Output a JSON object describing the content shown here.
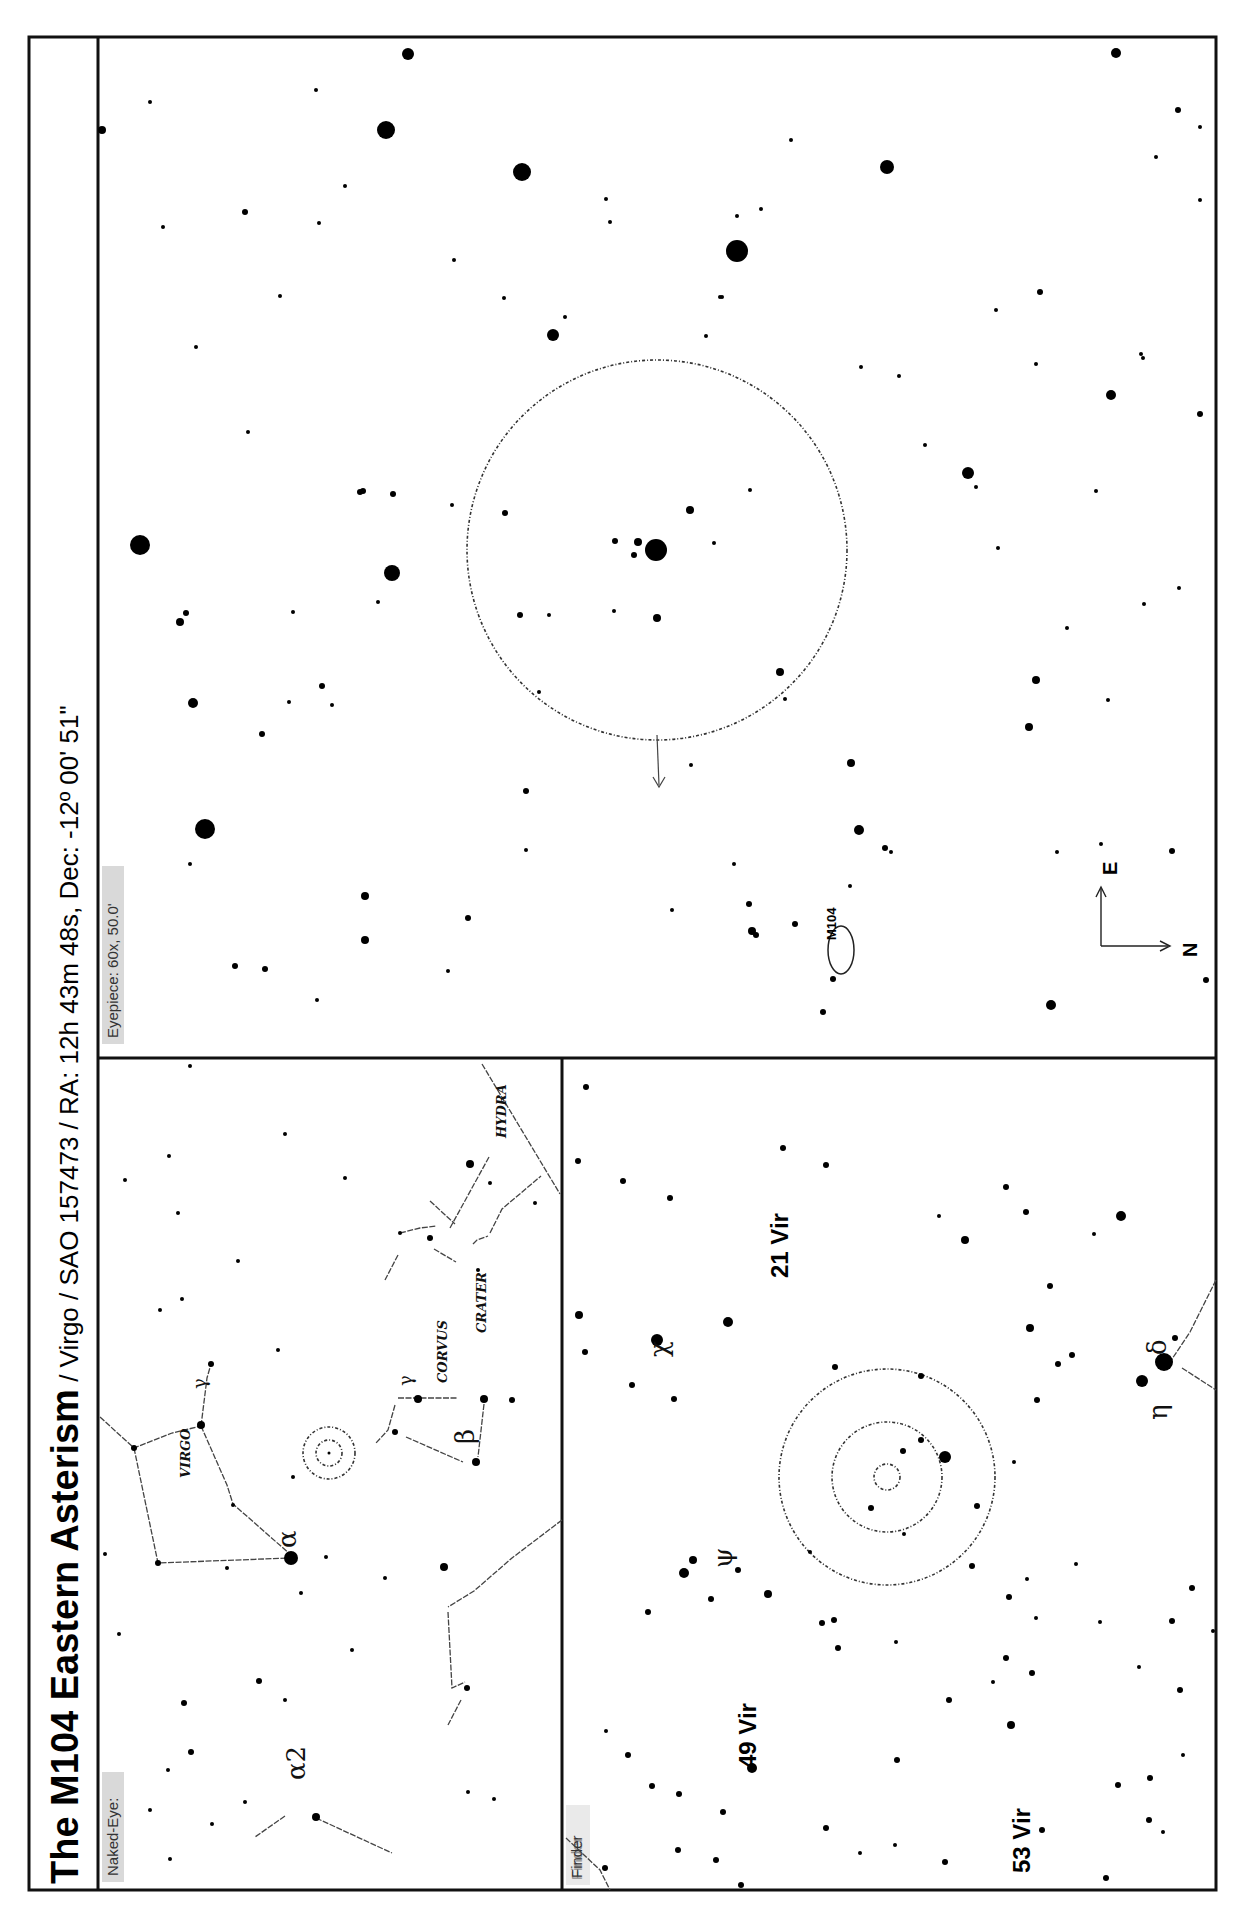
{
  "title": {
    "main": "The M104 Eastern Asterism",
    "details": " / Virgo / SAO 157473 / RA: 12h 43m 48s, Dec: -12º 00' 51\""
  },
  "panels": {
    "eyepiece": {
      "label": "Eyepiece: 60x, 50.0'",
      "object_label": "M104",
      "compass": {
        "east": "E",
        "north": "N"
      }
    },
    "naked_eye": {
      "label": "Naked-Eye:",
      "constellations": [
        "VIRGO",
        "CORVUS",
        "CRATER",
        "HYDRA"
      ],
      "star_labels": [
        "α",
        "α2",
        "β",
        "γ",
        "γ"
      ]
    },
    "finder": {
      "label": "Finder",
      "star_labels": [
        "21 Vir",
        "49 Vir",
        "53 Vir",
        "χ",
        "ψ",
        "η",
        "δ"
      ]
    }
  },
  "colors": {
    "ink": "#000000",
    "label_background": "#d9d9d9",
    "paper": "#ffffff"
  }
}
